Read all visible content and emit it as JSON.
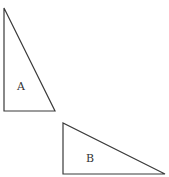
{
  "diagram": {
    "shapes": [
      {
        "id": "triangle-a",
        "label": "A",
        "type": "right-triangle",
        "points": "4,8 4,111 55,111",
        "label_pos": {
          "x": 17,
          "y": 90
        }
      },
      {
        "id": "triangle-b",
        "label": "B",
        "type": "right-triangle",
        "points": "63,123 63,174 165,174",
        "label_pos": {
          "x": 86,
          "y": 162
        }
      }
    ],
    "colors": {
      "stroke": "#3a3a3a",
      "fill": "#ffffff",
      "text": "#333333"
    }
  }
}
